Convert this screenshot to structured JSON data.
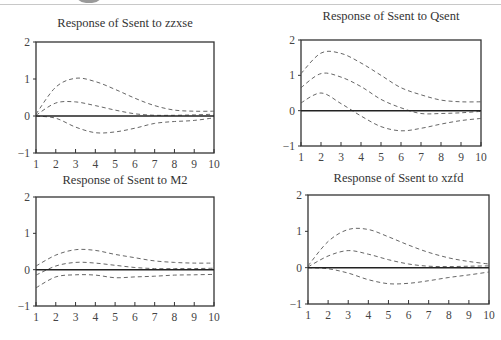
{
  "chart_data": [
    {
      "type": "line",
      "title": "Response of Ssent to zzxse",
      "xlabel": "",
      "ylabel": "",
      "x": [
        1,
        2,
        3,
        4,
        5,
        6,
        7,
        8,
        9,
        10
      ],
      "xlim": [
        1,
        10
      ],
      "ylim": [
        -1,
        2
      ],
      "yticks": [
        -1,
        0,
        1,
        2
      ],
      "grid": false,
      "series": [
        {
          "name": "upper band",
          "style": "dashed",
          "values": [
            0.05,
            0.78,
            1.02,
            0.93,
            0.72,
            0.48,
            0.28,
            0.16,
            0.13,
            0.13
          ]
        },
        {
          "name": "response",
          "style": "dashed",
          "values": [
            0.02,
            0.35,
            0.38,
            0.28,
            0.16,
            0.06,
            0.02,
            0.02,
            0.03,
            0.05
          ]
        },
        {
          "name": "lower band",
          "style": "dashed",
          "values": [
            0.0,
            -0.06,
            -0.3,
            -0.45,
            -0.43,
            -0.33,
            -0.2,
            -0.15,
            -0.12,
            -0.05
          ]
        },
        {
          "name": "zero line",
          "style": "solid",
          "values": [
            0,
            0,
            0,
            0,
            0,
            0,
            0,
            0,
            0,
            0
          ]
        }
      ]
    },
    {
      "type": "line",
      "title": "Response of Ssent to Qsent",
      "xlabel": "",
      "ylabel": "",
      "x": [
        1,
        2,
        3,
        4,
        5,
        6,
        7,
        8,
        9,
        10
      ],
      "xlim": [
        1,
        10
      ],
      "ylim": [
        -1,
        2
      ],
      "yticks": [
        -1,
        0,
        1,
        2
      ],
      "grid": false,
      "series": [
        {
          "name": "upper band",
          "style": "dashed",
          "values": [
            1.05,
            1.63,
            1.62,
            1.35,
            1.0,
            0.65,
            0.45,
            0.3,
            0.25,
            0.25
          ]
        },
        {
          "name": "response",
          "style": "dashed",
          "values": [
            0.65,
            1.05,
            0.95,
            0.68,
            0.32,
            0.08,
            -0.08,
            -0.08,
            -0.06,
            -0.02
          ]
        },
        {
          "name": "lower band",
          "style": "dashed",
          "values": [
            0.22,
            0.5,
            0.2,
            -0.15,
            -0.45,
            -0.57,
            -0.5,
            -0.38,
            -0.28,
            -0.22
          ]
        },
        {
          "name": "zero line",
          "style": "solid",
          "values": [
            0,
            0,
            0,
            0,
            0,
            0,
            0,
            0,
            0,
            0
          ]
        }
      ]
    },
    {
      "type": "line",
      "title": "Response of Ssent to M2",
      "xlabel": "",
      "ylabel": "",
      "x": [
        1,
        2,
        3,
        4,
        5,
        6,
        7,
        8,
        9,
        10
      ],
      "xlim": [
        1,
        10
      ],
      "ylim": [
        -1,
        2
      ],
      "yticks": [
        -1,
        0,
        1,
        2
      ],
      "grid": false,
      "series": [
        {
          "name": "upper band",
          "style": "dashed",
          "values": [
            0.1,
            0.4,
            0.55,
            0.53,
            0.42,
            0.33,
            0.24,
            0.2,
            0.18,
            0.18
          ]
        },
        {
          "name": "response",
          "style": "dashed",
          "values": [
            -0.15,
            0.1,
            0.2,
            0.18,
            0.12,
            0.06,
            0.03,
            0.03,
            0.03,
            0.04
          ]
        },
        {
          "name": "lower band",
          "style": "dashed",
          "values": [
            -0.5,
            -0.2,
            -0.14,
            -0.15,
            -0.22,
            -0.2,
            -0.18,
            -0.15,
            -0.14,
            -0.13
          ]
        },
        {
          "name": "zero line",
          "style": "solid",
          "values": [
            0,
            0,
            0,
            0,
            0,
            0,
            0,
            0,
            0,
            0
          ]
        }
      ]
    },
    {
      "type": "line",
      "title": "Response of Ssent to xzfd",
      "xlabel": "",
      "ylabel": "",
      "x": [
        1,
        2,
        3,
        4,
        5,
        6,
        7,
        8,
        9,
        10
      ],
      "xlim": [
        1,
        10
      ],
      "ylim": [
        -1,
        2
      ],
      "yticks": [
        -1,
        0,
        1,
        2
      ],
      "grid": false,
      "series": [
        {
          "name": "upper band",
          "style": "dashed",
          "values": [
            0.05,
            0.72,
            1.05,
            1.05,
            0.85,
            0.62,
            0.42,
            0.27,
            0.17,
            0.1
          ]
        },
        {
          "name": "response",
          "style": "dashed",
          "values": [
            0.02,
            0.32,
            0.47,
            0.37,
            0.22,
            0.1,
            0.04,
            0.03,
            0.04,
            0.05
          ]
        },
        {
          "name": "lower band",
          "style": "dashed",
          "values": [
            0.0,
            -0.03,
            -0.15,
            -0.33,
            -0.44,
            -0.43,
            -0.36,
            -0.27,
            -0.2,
            -0.12
          ]
        },
        {
          "name": "zero line",
          "style": "solid",
          "values": [
            0,
            0,
            0,
            0,
            0,
            0,
            0,
            0,
            0,
            0
          ]
        }
      ]
    }
  ],
  "layout": {
    "panels": [
      {
        "box": [
          36,
          42,
          214,
          153
        ],
        "title_y": 27
      },
      {
        "box": [
          301,
          40,
          481,
          146
        ],
        "title_y": 20
      },
      {
        "box": [
          36,
          197,
          214,
          306
        ],
        "title_y": 184
      },
      {
        "box": [
          308,
          195,
          489,
          304
        ],
        "title_y": 182
      }
    ],
    "line_color": "#555555",
    "axis_color": "#333333"
  }
}
